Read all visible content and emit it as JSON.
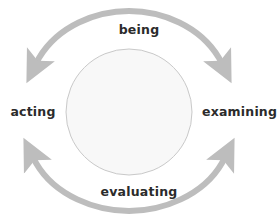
{
  "diagram": {
    "type": "cyclical-process-diagram",
    "title": "",
    "center_circle": {
      "name": "center-circle",
      "label": "",
      "cx": 129,
      "cy": 112,
      "r": 63,
      "fill": "#f8f8f8",
      "stroke": "#c9c9c9"
    },
    "arc_color": "#bdbdbd",
    "arc_stroke_width": 6,
    "labels": [
      {
        "id": "being",
        "text": "being",
        "position": "top"
      },
      {
        "id": "acting",
        "text": "acting",
        "position": "left"
      },
      {
        "id": "examining",
        "text": "examining",
        "position": "right"
      },
      {
        "id": "evaluating",
        "text": "evaluating",
        "position": "bottom"
      }
    ],
    "arrows": [
      {
        "id": "top-arc",
        "name": "top-arc-double-arrow",
        "spans": "acting-to-examining",
        "heads": [
          "left-end-down",
          "right-end-down"
        ],
        "over_label": "being"
      },
      {
        "id": "bottom-arc",
        "name": "bottom-arc-double-arrow",
        "spans": "acting-to-examining",
        "heads": [
          "left-end-up",
          "right-end-up"
        ],
        "over_label": "evaluating"
      }
    ],
    "text_color": "#2b2b2b",
    "background": "#ffffff"
  }
}
